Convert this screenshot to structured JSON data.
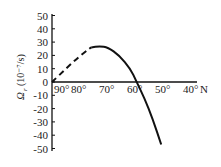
{
  "chart_data": {
    "type": "line",
    "title": "",
    "xlabel": "N",
    "ylabel": "Ω_r (10⁻⁷/s)",
    "x_ticks": [
      "90°",
      "80°",
      "70°",
      "60°",
      "50°",
      "40°"
    ],
    "x_unit_label": "N",
    "y_ticks": [
      "50",
      "40",
      "30",
      "20",
      "10",
      "0",
      "-10",
      "-20",
      "-30",
      "-40",
      "-50"
    ],
    "xlim": [
      90,
      40
    ],
    "ylim": [
      -50,
      50
    ],
    "grid": false,
    "series": [
      {
        "name": "dashed segment",
        "style": "dashed",
        "x": [
          90,
          86,
          82,
          78,
          76
        ],
        "y": [
          0,
          8,
          16,
          23,
          26
        ]
      },
      {
        "name": "solid segment",
        "style": "solid",
        "x": [
          76,
          73,
          70,
          66,
          62,
          60,
          57,
          54,
          51
        ],
        "y": [
          26,
          27,
          26,
          20,
          10,
          1,
          -12,
          -28,
          -47
        ]
      }
    ]
  },
  "labels": {
    "ylabel_main": "Ω",
    "ylabel_sub": "r",
    "ylabel_units": "(10⁻⁷/s)",
    "x_unit": "N"
  }
}
